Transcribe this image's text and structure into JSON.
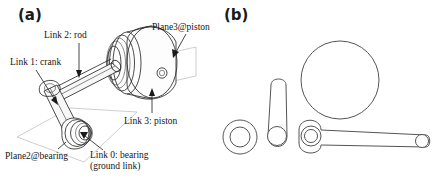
{
  "figure": {
    "panels": [
      {
        "id": "a",
        "label": "(a)",
        "caption_type": "assembled-3d-view"
      },
      {
        "id": "b",
        "label": "(b)",
        "caption_type": "exploded-2d-parts"
      }
    ]
  },
  "panel_a": {
    "label": "(a)",
    "callouts": [
      {
        "name": "link-2-rod",
        "text": "Link 2: rod"
      },
      {
        "name": "link-1-crank",
        "text": "Link 1: crank"
      },
      {
        "name": "plane3-piston",
        "text": "Plane3@piston"
      },
      {
        "name": "link-3-piston",
        "text": "Link 3: piston"
      },
      {
        "name": "plane2-bearing",
        "text": "Plane2@bearing"
      },
      {
        "name": "link-0-bearing",
        "text": "Link 0: bearing",
        "text_line2": "(ground link)"
      }
    ],
    "components": [
      "crank-arm",
      "connecting-rod",
      "piston-cylinder",
      "bearing-boss",
      "ground-reference-plane"
    ]
  },
  "panel_b": {
    "label": "(b)",
    "parts": [
      {
        "name": "bearing-ring",
        "shape": "annulus"
      },
      {
        "name": "crank-link",
        "shape": "rounded-slot-vertical"
      },
      {
        "name": "piston-circle",
        "shape": "circle"
      },
      {
        "name": "rod-link",
        "shape": "rounded-slot-horizontal"
      }
    ]
  },
  "colors": {
    "line": "#2b2b2b",
    "part_line": "#555555",
    "plane_line": "#b9b9b9",
    "text": "#151515",
    "background": "#ffffff"
  }
}
